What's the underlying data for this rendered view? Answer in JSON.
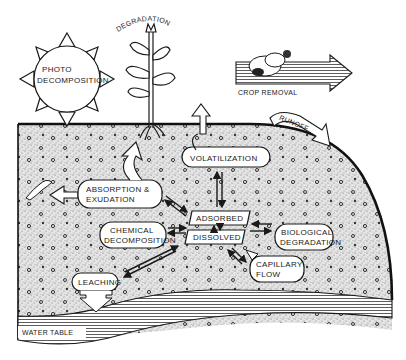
{
  "diagram": {
    "type": "environmental-fate-of-pesticides-in-soil",
    "labels": {
      "photo_decomposition_line1": "PHOTO",
      "photo_decomposition_line2": "DECOMPOSITION",
      "degradation_plant": "DEGRADATION",
      "crop_removal": "CROP  REMOVAL",
      "runoff": "RUNOFF",
      "volatilization": "VOLATILIZATION",
      "absorption_line1": "ABSORPTION  &",
      "absorption_line2": "EXUDATION",
      "adsorbed": "ADSORBED",
      "dissolved": "DISSOLVED",
      "chemical_decomposition_line1": "CHEMICAL",
      "chemical_decomposition_line2": "DECOMPOSITION",
      "biological_degradation_line1": "BIOLOGICAL",
      "biological_degradation_line2": "DEGRADATION",
      "capillary_flow_line1": "CAPILLARY",
      "capillary_flow_line2": "FLOW",
      "leaching": "LEACHING",
      "water_table": "WATER  TABLE"
    },
    "colors": {
      "ink": "#1a1a1a",
      "soil": "#d9d9d9",
      "paper": "#ffffff"
    }
  }
}
